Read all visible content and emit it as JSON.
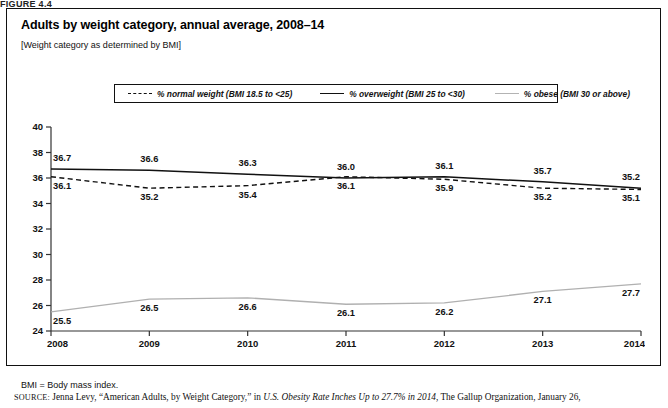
{
  "figure_label": "FIGURE 4.4",
  "chart_title": "Adults by weight category, annual average, 2008–14",
  "chart_subtitle": "[Weight category as determined by BMI]",
  "legend": {
    "entries": [
      {
        "style": "dashed",
        "label": "% normal weight (BMI 18.5 to <25)",
        "color": "#111111"
      },
      {
        "style": "solid",
        "label": "% overweight (BMI 25 to <30)",
        "color": "#111111"
      },
      {
        "style": "light",
        "label": "% obese (BMI 30 or above)",
        "color": "#b0b0b0"
      }
    ]
  },
  "footnote": "BMI = Body mass index.",
  "source": {
    "kicker": "SOURCE:",
    "part1": " Jenna Levy, “American Adults, by Weight Category,” in ",
    "italic": "U.S. Obesity Rate Inches Up to 27.7% in 2014",
    "part2": ", The Gallup Organization, January 26,"
  },
  "chart_data": {
    "type": "line",
    "title": "Adults by weight category, annual average, 2008–14",
    "subtitle": "[Weight category as determined by BMI]",
    "xlabel": "",
    "ylabel": "",
    "x": [
      2008,
      2009,
      2010,
      2011,
      2012,
      2013,
      2014
    ],
    "categories": [
      "2008",
      "2009",
      "2010",
      "2011",
      "2012",
      "2013",
      "2014"
    ],
    "ylim": [
      24,
      40
    ],
    "yticks": [
      24,
      26,
      28,
      30,
      32,
      34,
      36,
      38,
      40
    ],
    "grid": false,
    "legend_position": "top-center",
    "series": [
      {
        "name": "% overweight (BMI 25 to <30)",
        "style": "solid",
        "color": "#111111",
        "values": [
          36.7,
          36.6,
          36.3,
          36.0,
          36.1,
          35.7,
          35.2
        ],
        "labels": [
          "36.7",
          "36.6",
          "36.3",
          "36.0",
          "36.1",
          "35.7",
          "35.2"
        ],
        "label_offset_y": -8
      },
      {
        "name": "% normal weight (BMI 18.5 to <25)",
        "style": "dashed",
        "color": "#111111",
        "values": [
          36.1,
          35.2,
          35.4,
          36.1,
          35.9,
          35.2,
          35.1
        ],
        "labels": [
          "36.1",
          "35.2",
          "35.4",
          "36.1",
          "35.9",
          "35.2",
          "35.1"
        ],
        "label_offset_y": 12
      },
      {
        "name": "% obese (BMI 30 or above)",
        "style": "light",
        "color": "#b0b0b0",
        "values": [
          25.5,
          26.5,
          26.6,
          26.1,
          26.2,
          27.1,
          27.7
        ],
        "labels": [
          "25.5",
          "26.5",
          "26.6",
          "26.1",
          "26.2",
          "27.1",
          "27.7"
        ],
        "label_offset_y": 12
      }
    ]
  }
}
